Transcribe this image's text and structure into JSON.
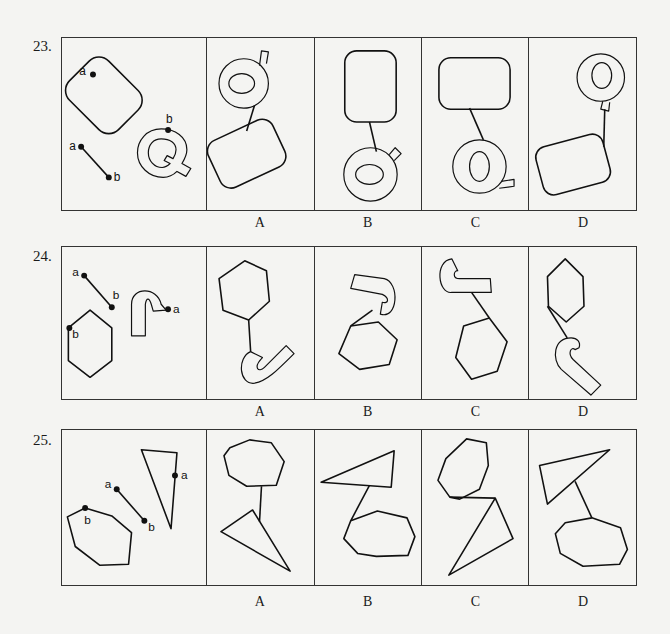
{
  "questions": [
    {
      "number": "23.",
      "given": {
        "description": "Rounded rectangle with point a, line segment a-b, letter Q outline with point b",
        "points": [
          "a",
          "a",
          "b",
          "b"
        ]
      },
      "options": [
        {
          "label": "A",
          "description": "Q on top connected by line to tilted rounded rectangle below"
        },
        {
          "label": "B",
          "description": "Tall rounded rectangle on top connected by line to rotated Q below"
        },
        {
          "label": "C",
          "description": "Wide rounded rectangle on top connected by line to Q below"
        },
        {
          "label": "D",
          "description": "Q on top right connected by line to tilted rounded rectangle below"
        }
      ]
    },
    {
      "number": "24.",
      "given": {
        "description": "Line segment a-b, hexagon with point b, J-hook shape with point a",
        "points": [
          "a",
          "b",
          "a",
          "b"
        ]
      },
      "options": [
        {
          "label": "A",
          "description": "Hexagon on top connected by line to hook below"
        },
        {
          "label": "B",
          "description": "Hook on top connected by line to hexagon below"
        },
        {
          "label": "C",
          "description": "Hook on top connected by line to hexagon below right"
        },
        {
          "label": "D",
          "description": "Hexagon on top connected by line to hook below"
        }
      ]
    },
    {
      "number": "25.",
      "given": {
        "description": "Octagon with point b, line segment a-b, triangle with point a",
        "points": [
          "a",
          "b",
          "a",
          "b"
        ]
      },
      "options": [
        {
          "label": "A",
          "description": "Octagon on top connected by line to triangle below"
        },
        {
          "label": "B",
          "description": "Triangle on top connected by line to octagon below"
        },
        {
          "label": "C",
          "description": "Octagon on top touching triangle below"
        },
        {
          "label": "D",
          "description": "Triangle on top connected by line to octagon below"
        }
      ]
    }
  ],
  "point_labels": {
    "a": "a",
    "b": "b"
  }
}
